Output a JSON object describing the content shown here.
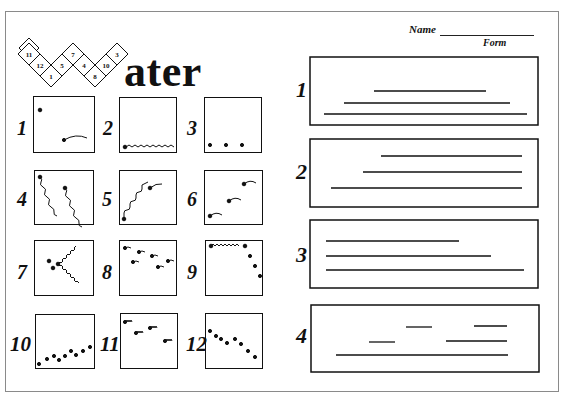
{
  "header": {
    "title_rest": "ater",
    "title_letter_shape": "W built from 12 numbered diamonds",
    "diamond_numbers": [
      "11",
      "12",
      "1",
      "5",
      "7",
      "4",
      "8",
      "10",
      "3"
    ],
    "name_label": "Name",
    "form_label": "Form"
  },
  "pictures": {
    "items": [
      {
        "number": "1",
        "content": "dot top-left, dot with curved trail bottom-right"
      },
      {
        "number": "2",
        "content": "dot with zigzag line along bottom"
      },
      {
        "number": "3",
        "content": "three dots along bottom"
      },
      {
        "number": "4",
        "content": "two dots with wavy diagonal trails"
      },
      {
        "number": "5",
        "content": "wavy rising line with dot and curved trail"
      },
      {
        "number": "6",
        "content": "three dots with short curved trails rising"
      },
      {
        "number": "7",
        "content": "dots with zigzag V shape"
      },
      {
        "number": "8",
        "content": "scattered dots with short trails"
      },
      {
        "number": "9",
        "content": "zigzag along top then dots falling down right"
      },
      {
        "number": "10",
        "content": "rising row of dots"
      },
      {
        "number": "11",
        "content": "dots with small zigzag trails"
      },
      {
        "number": "12",
        "content": "falling row of dots"
      }
    ]
  },
  "patterns": {
    "items": [
      {
        "number": "1",
        "content": "three lines forming a pyramid"
      },
      {
        "number": "2",
        "content": "three right-aligned lines growing longer"
      },
      {
        "number": "3",
        "content": "three left-aligned lines growing longer"
      },
      {
        "number": "4",
        "content": "short dashes above a long line"
      }
    ]
  }
}
